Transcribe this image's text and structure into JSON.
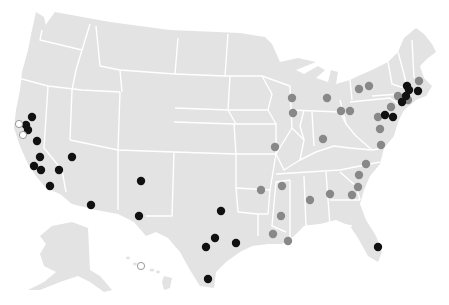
{
  "map": {
    "region": "United States",
    "colors": {
      "land": "#e3e3e3",
      "borders": "#ffffff",
      "background": "#ffffff",
      "category_black": "#111111",
      "category_gray": "#888888",
      "category_hollow_stroke": "#999999",
      "category_hollow_fill": "#ffffff"
    },
    "markers": [
      {
        "x": 32,
        "y": 117,
        "type": "black"
      },
      {
        "x": 26,
        "y": 125,
        "type": "black"
      },
      {
        "x": 28,
        "y": 130,
        "type": "black"
      },
      {
        "x": 19,
        "y": 124,
        "type": "hollow"
      },
      {
        "x": 23,
        "y": 135,
        "type": "hollow"
      },
      {
        "x": 37,
        "y": 141,
        "type": "black"
      },
      {
        "x": 40,
        "y": 157,
        "type": "black"
      },
      {
        "x": 34,
        "y": 166,
        "type": "black"
      },
      {
        "x": 41,
        "y": 170,
        "type": "black"
      },
      {
        "x": 59,
        "y": 170,
        "type": "black"
      },
      {
        "x": 50,
        "y": 186,
        "type": "black"
      },
      {
        "x": 72,
        "y": 157,
        "type": "black"
      },
      {
        "x": 91,
        "y": 205,
        "type": "black"
      },
      {
        "x": 141,
        "y": 181,
        "type": "black"
      },
      {
        "x": 139,
        "y": 216,
        "type": "black"
      },
      {
        "x": 221,
        "y": 211,
        "type": "black"
      },
      {
        "x": 215,
        "y": 238,
        "type": "black"
      },
      {
        "x": 206,
        "y": 247,
        "type": "black"
      },
      {
        "x": 236,
        "y": 243,
        "type": "black"
      },
      {
        "x": 208,
        "y": 279,
        "type": "black"
      },
      {
        "x": 141,
        "y": 266,
        "type": "hollow"
      },
      {
        "x": 292,
        "y": 98,
        "type": "gray"
      },
      {
        "x": 293,
        "y": 113,
        "type": "gray"
      },
      {
        "x": 327,
        "y": 98,
        "type": "gray"
      },
      {
        "x": 341,
        "y": 111,
        "type": "gray"
      },
      {
        "x": 350,
        "y": 111,
        "type": "gray"
      },
      {
        "x": 323,
        "y": 139,
        "type": "gray"
      },
      {
        "x": 275,
        "y": 147,
        "type": "gray"
      },
      {
        "x": 359,
        "y": 89,
        "type": "gray"
      },
      {
        "x": 369,
        "y": 86,
        "type": "gray"
      },
      {
        "x": 407,
        "y": 86,
        "type": "black"
      },
      {
        "x": 409,
        "y": 90,
        "type": "black"
      },
      {
        "x": 418,
        "y": 91,
        "type": "black"
      },
      {
        "x": 419,
        "y": 81,
        "type": "gray"
      },
      {
        "x": 402,
        "y": 102,
        "type": "black"
      },
      {
        "x": 406,
        "y": 96,
        "type": "black"
      },
      {
        "x": 398,
        "y": 96,
        "type": "gray"
      },
      {
        "x": 408,
        "y": 100,
        "type": "gray"
      },
      {
        "x": 391,
        "y": 107,
        "type": "gray"
      },
      {
        "x": 385,
        "y": 115,
        "type": "black"
      },
      {
        "x": 393,
        "y": 117,
        "type": "black"
      },
      {
        "x": 378,
        "y": 117,
        "type": "gray"
      },
      {
        "x": 380,
        "y": 129,
        "type": "gray"
      },
      {
        "x": 381,
        "y": 145,
        "type": "gray"
      },
      {
        "x": 366,
        "y": 164,
        "type": "gray"
      },
      {
        "x": 359,
        "y": 175,
        "type": "gray"
      },
      {
        "x": 358,
        "y": 187,
        "type": "gray"
      },
      {
        "x": 352,
        "y": 195,
        "type": "gray"
      },
      {
        "x": 330,
        "y": 194,
        "type": "gray"
      },
      {
        "x": 310,
        "y": 200,
        "type": "gray"
      },
      {
        "x": 282,
        "y": 186,
        "type": "gray"
      },
      {
        "x": 261,
        "y": 190,
        "type": "gray"
      },
      {
        "x": 281,
        "y": 216,
        "type": "gray"
      },
      {
        "x": 273,
        "y": 234,
        "type": "gray"
      },
      {
        "x": 288,
        "y": 241,
        "type": "gray"
      },
      {
        "x": 378,
        "y": 247,
        "type": "black"
      }
    ]
  }
}
